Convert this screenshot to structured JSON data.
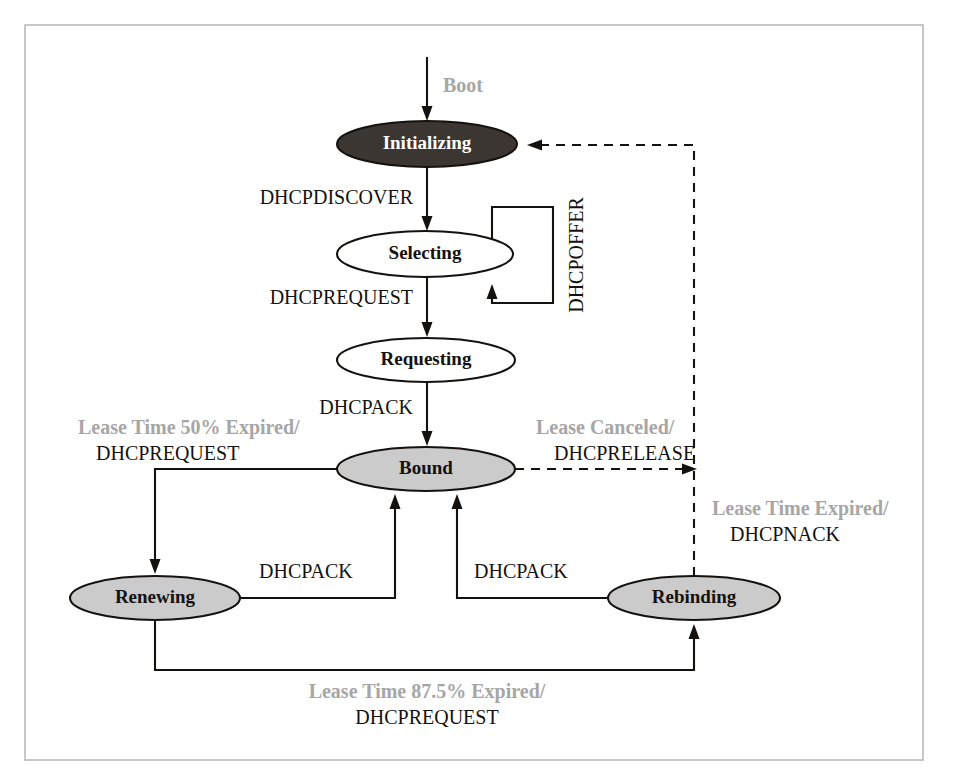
{
  "figure": {
    "frame": {
      "x": 25,
      "y": 25,
      "width": 898,
      "height": 735,
      "stroke": "#b9b9b9"
    },
    "colors": {
      "dark_state_fill": "#3b3631",
      "gray_state_fill": "#cbcbcb",
      "white_state_fill": "#ffffff",
      "state_stroke": "#14110f",
      "edge_stroke": "#14110f",
      "event_text": "#a6a6a6",
      "action_text": "#14110f",
      "frame_border": "#b9b9b9",
      "background": "#ffffff"
    }
  },
  "states": [
    {
      "id": "initializing",
      "label": "Initializing",
      "cx": 427,
      "cy": 144,
      "rx": 90,
      "ry": 23,
      "fill": "dark",
      "text": "on-dark"
    },
    {
      "id": "selecting",
      "label": "Selecting",
      "cx": 425,
      "cy": 254,
      "rx": 88,
      "ry": 23,
      "fill": "white",
      "text": "on-light"
    },
    {
      "id": "requesting",
      "label": "Requesting",
      "cx": 426,
      "cy": 360,
      "rx": 89,
      "ry": 22,
      "fill": "white",
      "text": "on-light"
    },
    {
      "id": "bound",
      "label": "Bound",
      "cx": 426,
      "cy": 469,
      "rx": 89,
      "ry": 22,
      "fill": "gray",
      "text": "on-light"
    },
    {
      "id": "renewing",
      "label": "Renewing",
      "cx": 155,
      "cy": 598,
      "rx": 85,
      "ry": 22,
      "fill": "gray",
      "text": "on-light"
    },
    {
      "id": "rebinding",
      "label": "Rebinding",
      "cx": 694,
      "cy": 598,
      "rx": 86,
      "ry": 22,
      "fill": "gray",
      "text": "on-light"
    }
  ],
  "transitions": [
    {
      "id": "boot",
      "from": "",
      "to": "initializing",
      "event": "Boot",
      "action": "",
      "style": "solid",
      "path": "M 427 57 L 427 117",
      "arrow": {
        "x": 427,
        "y": 121,
        "dir": "down"
      },
      "label": {
        "x": 443,
        "y": 92,
        "align": "start",
        "lines": [
          {
            "text": "Boot",
            "kind": "event"
          }
        ]
      }
    },
    {
      "id": "initializing-to-selecting",
      "from": "initializing",
      "to": "selecting",
      "event": "",
      "action": "DHCPDISCOVER",
      "style": "solid",
      "path": "M 427 167 L 427 227",
      "arrow": {
        "x": 427,
        "y": 231,
        "dir": "down"
      },
      "label": {
        "x": 413,
        "y": 204,
        "align": "end",
        "lines": [
          {
            "text": "DHCPDISCOVER",
            "kind": "action"
          }
        ]
      }
    },
    {
      "id": "selecting-self-loop",
      "from": "selecting",
      "to": "selecting",
      "event": "",
      "action": "DHCPOFFER",
      "style": "solid",
      "path": "M 492 240 L 492 207 L 553 207 L 553 303 L 492 303 L 492 288",
      "arrow": {
        "x": 492,
        "y": 284,
        "dir": "up"
      },
      "label": {
        "x": 578,
        "y": 255,
        "align": "vertical",
        "lines": [
          {
            "text": "DHCPOFFER",
            "kind": "vertical"
          }
        ]
      }
    },
    {
      "id": "selecting-to-requesting",
      "from": "selecting",
      "to": "requesting",
      "event": "",
      "action": "DHCPREQUEST",
      "style": "solid",
      "path": "M 427 277 L 427 333",
      "arrow": {
        "x": 427,
        "y": 337,
        "dir": "down"
      },
      "label": {
        "x": 413,
        "y": 304,
        "align": "end",
        "lines": [
          {
            "text": "DHCPREQUEST",
            "kind": "action"
          }
        ]
      }
    },
    {
      "id": "requesting-to-bound",
      "from": "requesting",
      "to": "bound",
      "event": "",
      "action": "DHCPACK",
      "style": "solid",
      "path": "M 427 382 L 427 442",
      "arrow": {
        "x": 427,
        "y": 446,
        "dir": "down"
      },
      "label": {
        "x": 413,
        "y": 414,
        "align": "end",
        "lines": [
          {
            "text": "DHCPACK",
            "kind": "action"
          }
        ]
      }
    },
    {
      "id": "bound-to-renewing",
      "from": "bound",
      "to": "renewing",
      "event": "Lease Time 50% Expired/",
      "action": "DHCPREQUEST",
      "style": "solid",
      "path": "M 337 469 L 155 469 L 155 570",
      "arrow": {
        "x": 155,
        "y": 574,
        "dir": "down"
      },
      "label": {
        "x": 78,
        "y": 434,
        "align": "start",
        "lines": [
          {
            "text": "Lease Time 50% Expired/",
            "kind": "event"
          },
          {
            "text": "DHCPREQUEST",
            "kind": "action"
          }
        ]
      }
    },
    {
      "id": "renewing-to-bound",
      "from": "renewing",
      "to": "bound",
      "event": "",
      "action": "DHCPACK",
      "style": "solid",
      "path": "M 240 598 L 395 598 L 395 498",
      "arrow": {
        "x": 395,
        "y": 494,
        "dir": "up"
      },
      "label": {
        "x": 259,
        "y": 578,
        "align": "start",
        "lines": [
          {
            "text": "DHCPACK",
            "kind": "action"
          }
        ]
      }
    },
    {
      "id": "rebinding-to-bound",
      "from": "rebinding",
      "to": "bound",
      "event": "",
      "action": "DHCPACK",
      "style": "solid",
      "path": "M 608 598 L 457 598 L 457 498",
      "arrow": {
        "x": 457,
        "y": 494,
        "dir": "up"
      },
      "label": {
        "x": 474,
        "y": 578,
        "align": "start",
        "lines": [
          {
            "text": "DHCPACK",
            "kind": "action"
          }
        ]
      }
    },
    {
      "id": "renewing-to-rebinding",
      "from": "renewing",
      "to": "rebinding",
      "event": "Lease Time 87.5% Expired/",
      "action": "DHCPREQUEST",
      "style": "solid",
      "path": "M 155 620 L 155 670 L 694 670 L 694 628",
      "arrow": {
        "x": 694,
        "y": 624,
        "dir": "up"
      },
      "label": {
        "x": 427,
        "y": 698,
        "align": "middle",
        "lines": [
          {
            "text": "Lease Time 87.5% Expired/",
            "kind": "event"
          },
          {
            "text": "DHCPREQUEST",
            "kind": "action"
          }
        ]
      }
    },
    {
      "id": "bound-to-initializing",
      "from": "bound",
      "to": "initializing",
      "event": "Lease Canceled/",
      "action": "DHCPRELEASE",
      "style": "dashed",
      "path": "M 515 469 L 693 469",
      "arrow": {
        "x": 697,
        "y": 469,
        "dir": "right"
      },
      "label": {
        "x": 536,
        "y": 434,
        "align": "start",
        "lines": [
          {
            "text": "Lease Canceled/",
            "kind": "event"
          },
          {
            "text": "DHCPRELEASE",
            "kind": "action"
          }
        ]
      }
    },
    {
      "id": "rebinding-to-initializing",
      "from": "rebinding",
      "to": "initializing",
      "event": "Lease Time Expired/",
      "action": "DHCPNACK",
      "style": "dashed",
      "path": "M 694 576 L 694 145 L 531 145",
      "arrow": {
        "x": 527,
        "y": 145,
        "dir": "left"
      },
      "label": {
        "x": 712,
        "y": 515,
        "align": "start",
        "lines": [
          {
            "text": "Lease Time Expired/",
            "kind": "event"
          },
          {
            "text": "DHCPNACK",
            "kind": "action"
          }
        ]
      }
    }
  ]
}
